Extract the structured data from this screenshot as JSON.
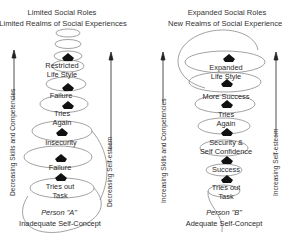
{
  "panels": [
    {
      "id": "A",
      "top_title": "Limited Social Roles",
      "sub_title": "Limited Realms of Social Experiences",
      "left_axis": "Decreasing Skills and Competencies",
      "right_axis": "Decreasing Self-esteem",
      "stages": [
        {
          "line1": "Restricted",
          "line2": "Life Style"
        },
        {
          "line1": "Failure",
          "line2": ""
        },
        {
          "line1": "Tries",
          "line2": "Again"
        },
        {
          "line1": "Insecurity",
          "line2": ""
        },
        {
          "line1": "Failure",
          "line2": ""
        },
        {
          "line1": "Tries out",
          "line2": "Task"
        }
      ],
      "person": "Person \"A\"",
      "concept": "Inadequate Self-Concept"
    },
    {
      "id": "B",
      "top_title": "Expanded Social Roles",
      "sub_title": "New Realms of Social Experiences",
      "left_axis": "Increasing Skills and Competencies",
      "right_axis": "Increasing Self-esteem",
      "stages": [
        {
          "line1": "Expanded",
          "line2": "Life Style"
        },
        {
          "line1": "More Success",
          "line2": ""
        },
        {
          "line1": "Tries",
          "line2": "Again"
        },
        {
          "line1": "Security &",
          "line2": "Self Confidence"
        },
        {
          "line1": "Success",
          "line2": ""
        },
        {
          "line1": "Tries out",
          "line2": "Task"
        }
      ],
      "person": "Person \"B\"",
      "concept": "Adequate Self-Concept"
    }
  ],
  "icons": {
    "arrow": "up-arrow",
    "stage_marker": "up-arrow-pentagon"
  }
}
